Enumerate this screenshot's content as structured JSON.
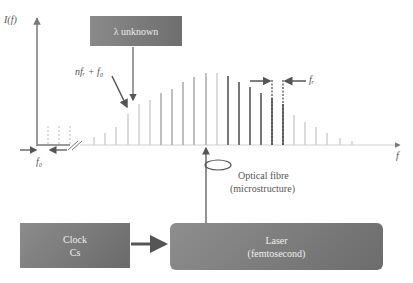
{
  "axes": {
    "y_label": "I(f)",
    "x_label": "f"
  },
  "labels": {
    "offset_freq": "f₀",
    "rep_rate": "fᵣ",
    "comb_mode": "nfᵣ + f₀",
    "fibre_line1": "Optical fibre",
    "fibre_line2": "(microstructure)"
  },
  "boxes": {
    "lambda": {
      "label": "λ unknown"
    },
    "clock": {
      "line1": "Clock",
      "line2": "Cs"
    },
    "laser": {
      "line1": "Laser",
      "line2": "(femtosecond)"
    }
  },
  "colors": {
    "box_dark": "#6e6e6e",
    "box_light": "#8c8c8c",
    "axis": "#777777",
    "comb_light": "#cfcfcf",
    "comb_mid": "#a8a8a8",
    "comb_dark": "#777777",
    "arrow": "#555555"
  },
  "comb": {
    "baseline_y": 145,
    "lines": [
      {
        "x": 94,
        "top": 137,
        "shade": "light"
      },
      {
        "x": 105,
        "top": 133,
        "shade": "light"
      },
      {
        "x": 116,
        "top": 127,
        "shade": "light"
      },
      {
        "x": 128,
        "top": 114,
        "shade": "light"
      },
      {
        "x": 139,
        "top": 104,
        "shade": "light"
      },
      {
        "x": 150,
        "top": 100,
        "shade": "light"
      },
      {
        "x": 161,
        "top": 93,
        "shade": "mid"
      },
      {
        "x": 172,
        "top": 89,
        "shade": "mid"
      },
      {
        "x": 183,
        "top": 82,
        "shade": "mid"
      },
      {
        "x": 194,
        "top": 77,
        "shade": "mid"
      },
      {
        "x": 206,
        "top": 73,
        "shade": "mid"
      },
      {
        "x": 217,
        "top": 73,
        "shade": "light"
      },
      {
        "x": 228,
        "top": 76,
        "shade": "dark"
      },
      {
        "x": 239,
        "top": 82,
        "shade": "dark"
      },
      {
        "x": 250,
        "top": 87,
        "shade": "dark"
      },
      {
        "x": 261,
        "top": 93,
        "shade": "dark"
      },
      {
        "x": 272,
        "top": 98,
        "shade": "dark"
      },
      {
        "x": 283,
        "top": 104,
        "shade": "dark"
      },
      {
        "x": 294,
        "top": 115,
        "shade": "light"
      },
      {
        "x": 305,
        "top": 122,
        "shade": "light"
      },
      {
        "x": 316,
        "top": 127,
        "shade": "light"
      },
      {
        "x": 327,
        "top": 133,
        "shade": "light"
      },
      {
        "x": 340,
        "top": 138,
        "shade": "light"
      },
      {
        "x": 352,
        "top": 141,
        "shade": "light"
      }
    ]
  }
}
